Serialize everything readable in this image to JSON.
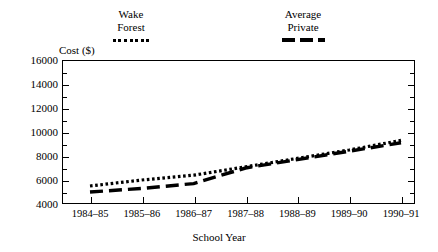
{
  "chart_data": {
    "type": "line",
    "title": "",
    "xlabel": "School Year",
    "ylabel": "Cost ($)",
    "categories": [
      "1984–85",
      "1985–86",
      "1986–87",
      "1987–88",
      "1988–89",
      "1989–90",
      "1990–91"
    ],
    "ylim": [
      4000,
      16000
    ],
    "ytick_values": [
      4000,
      6000,
      8000,
      10000,
      12000,
      14000,
      16000
    ],
    "ytick_labels": [
      "4000",
      "6000",
      "8000",
      "10000",
      "12000",
      "14000",
      "16000"
    ],
    "minor_ticks": true,
    "grid": false,
    "legend_position": "above-plot",
    "series": [
      {
        "name": "Wake Forest",
        "name_lines": [
          "Wake",
          "Forest"
        ],
        "style": "dotted",
        "color": "#000000",
        "values": [
          5500,
          6000,
          6400,
          7100,
          7800,
          8500,
          9300
        ]
      },
      {
        "name": "Average Private",
        "name_lines": [
          "Average",
          "Private"
        ],
        "style": "dashed",
        "color": "#000000",
        "values": [
          5000,
          5300,
          5700,
          7000,
          7700,
          8400,
          9100
        ]
      }
    ]
  }
}
